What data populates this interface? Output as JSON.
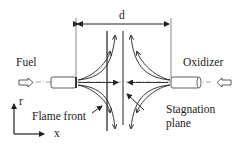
{
  "diagram": {
    "labels": {
      "distance": "d",
      "fuel": "Fuel",
      "oxidizer": "Oxidizer",
      "flame_front": "Flame front",
      "stagnation_line1": "Stagnation",
      "stagnation_line2": "plane",
      "axis_r": "r",
      "axis_x": "x"
    },
    "colors": {
      "line": "#222222",
      "flame_front": "#666666"
    }
  }
}
